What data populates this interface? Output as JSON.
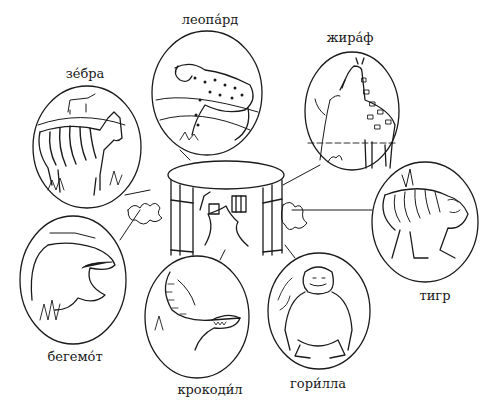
{
  "illustration": {
    "theme": "zoo animals",
    "center": "zoo enclosure with path",
    "animals": [
      {
        "id": "leopard",
        "label": "леопа́рд"
      },
      {
        "id": "giraffe",
        "label": "жира́ф"
      },
      {
        "id": "zebra",
        "label": "зе́бра"
      },
      {
        "id": "tiger",
        "label": "тигр"
      },
      {
        "id": "hippo",
        "label": "бегемо́т"
      },
      {
        "id": "crocodile",
        "label": "крокоди́л"
      },
      {
        "id": "gorilla",
        "label": "гори́лла"
      }
    ]
  },
  "colors": {
    "ink": "#1a1a1a",
    "paper": "#ffffff"
  }
}
